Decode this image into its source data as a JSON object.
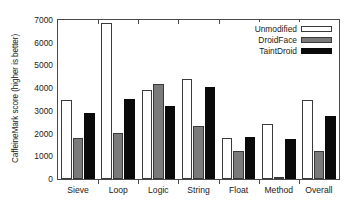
{
  "chart_data": {
    "type": "bar",
    "title": "",
    "subtitle": "",
    "xlabel": "",
    "ylabel": "CaffeineMark score (higher is better)",
    "categories": [
      "Sieve",
      "Loop",
      "Logic",
      "String",
      "Float",
      "Method",
      "Overall"
    ],
    "series": [
      {
        "name": "Unmodified",
        "color": "#ffffff",
        "values": [
          3470,
          6890,
          3930,
          4420,
          1790,
          2440,
          3500
        ]
      },
      {
        "name": "DroidFace",
        "color": "#7a7a7a",
        "values": [
          1820,
          2030,
          4190,
          2350,
          1220,
          100,
          1220
        ]
      },
      {
        "name": "TaintDroid",
        "color": "#0a0a0a",
        "values": [
          2890,
          3530,
          3230,
          4030,
          1860,
          1750,
          2760
        ]
      }
    ],
    "ylim": [
      0,
      7000
    ],
    "yticks": [
      0,
      1000,
      2000,
      3000,
      4000,
      5000,
      6000,
      7000
    ],
    "ytick_labels": [
      "0",
      "1000",
      "2000",
      "3000",
      "4000",
      "5000",
      "6000",
      "7000"
    ],
    "grid": false,
    "legend_position": "top-right",
    "legend_entries": [
      "Unmodified",
      "DroidFace",
      "TaintDroid"
    ]
  }
}
